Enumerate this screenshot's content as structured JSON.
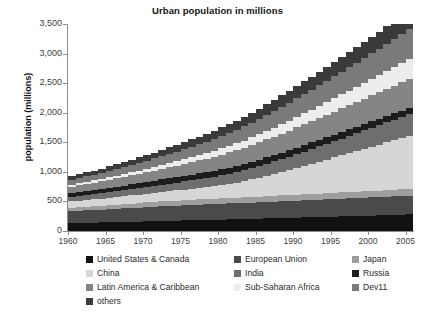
{
  "chart_data": {
    "type": "area",
    "title": "Urban population in millions",
    "xlabel": "",
    "ylabel": "population (millions)",
    "ylim": [
      0,
      3500
    ],
    "xlim": [
      1960,
      2006
    ],
    "ytick_labels": [
      "0",
      "500",
      "1,000",
      "1,500",
      "2,000",
      "2,500",
      "3,000",
      "3,500"
    ],
    "ytick_values": [
      0,
      500,
      1000,
      1500,
      2000,
      2500,
      3000,
      3500
    ],
    "xtick_labels": [
      "1960",
      "1965",
      "1970",
      "1975",
      "1980",
      "1985",
      "1990",
      "1995",
      "2000",
      "2005"
    ],
    "xtick_values": [
      1960,
      1965,
      1970,
      1975,
      1980,
      1985,
      1990,
      1995,
      2000,
      2005
    ],
    "grid": false,
    "stacked": true,
    "legend_position": "bottom",
    "x": [
      1960,
      1961,
      1962,
      1963,
      1964,
      1965,
      1966,
      1967,
      1968,
      1969,
      1970,
      1971,
      1972,
      1973,
      1974,
      1975,
      1976,
      1977,
      1978,
      1979,
      1980,
      1981,
      1982,
      1983,
      1984,
      1985,
      1986,
      1987,
      1988,
      1989,
      1990,
      1991,
      1992,
      1993,
      1994,
      1995,
      1996,
      1997,
      1998,
      1999,
      2000,
      2001,
      2002,
      2003,
      2004,
      2005,
      2006
    ],
    "series": [
      {
        "name": "United States & Canada",
        "color": "#111111",
        "values": [
          133,
          136,
          139,
          142,
          145,
          148,
          151,
          154,
          157,
          160,
          163,
          166,
          169,
          172,
          175,
          178,
          181,
          184,
          187,
          190,
          193,
          196,
          199,
          202,
          205,
          208,
          212,
          215,
          218,
          222,
          225,
          229,
          232,
          236,
          239,
          243,
          247,
          250,
          254,
          258,
          262,
          265,
          269,
          273,
          277,
          281,
          285
        ]
      },
      {
        "name": "European Union",
        "color": "#4a4a4a",
        "values": [
          200,
          204,
          208,
          212,
          216,
          220,
          224,
          228,
          232,
          236,
          240,
          244,
          248,
          251,
          254,
          257,
          260,
          262,
          264,
          266,
          268,
          270,
          272,
          274,
          276,
          278,
          280,
          282,
          284,
          286,
          288,
          290,
          292,
          294,
          296,
          298,
          300,
          302,
          304,
          306,
          308,
          310,
          312,
          314,
          316,
          318,
          320
        ]
      },
      {
        "name": "Japan",
        "color": "#9e9e9e",
        "values": [
          59,
          61,
          63,
          65,
          67,
          69,
          71,
          73,
          75,
          77,
          79,
          81,
          83,
          84,
          85,
          86,
          87,
          88,
          89,
          90,
          91,
          92,
          93,
          94,
          95,
          96,
          97,
          98,
          99,
          100,
          101,
          102,
          103,
          104,
          104,
          105,
          105,
          106,
          106,
          107,
          107,
          108,
          108,
          109,
          109,
          110,
          110
        ]
      },
      {
        "name": "China",
        "color": "#d6d6d6",
        "values": [
          107,
          110,
          113,
          117,
          121,
          125,
          130,
          134,
          139,
          144,
          149,
          155,
          161,
          167,
          173,
          180,
          188,
          196,
          205,
          215,
          226,
          240,
          256,
          275,
          296,
          320,
          345,
          370,
          396,
          422,
          450,
          478,
          508,
          538,
          568,
          598,
          628,
          658,
          688,
          718,
          748,
          778,
          808,
          838,
          868,
          898,
          928
        ]
      },
      {
        "name": "India",
        "color": "#6e6e6e",
        "values": [
          79,
          82,
          85,
          88,
          91,
          95,
          98,
          102,
          106,
          110,
          114,
          118,
          122,
          127,
          132,
          137,
          142,
          147,
          152,
          158,
          164,
          170,
          176,
          183,
          190,
          197,
          204,
          211,
          219,
          226,
          234,
          242,
          250,
          258,
          267,
          275,
          284,
          293,
          302,
          311,
          320,
          329,
          339,
          348,
          358,
          368,
          378
        ]
      },
      {
        "name": "Russia",
        "color": "#1c1c1c",
        "values": [
          64,
          66,
          68,
          70,
          72,
          74,
          76,
          78,
          80,
          82,
          84,
          86,
          88,
          90,
          92,
          94,
          96,
          98,
          100,
          102,
          104,
          105,
          106,
          107,
          108,
          109,
          110,
          110,
          111,
          112,
          113,
          113,
          113,
          112,
          112,
          111,
          111,
          110,
          110,
          109,
          109,
          108,
          108,
          107,
          107,
          106,
          106
        ]
      },
      {
        "name": "Latin America & Caribbean",
        "color": "#858585",
        "values": [
          107,
          112,
          117,
          122,
          127,
          133,
          139,
          145,
          151,
          158,
          165,
          172,
          179,
          187,
          195,
          203,
          211,
          219,
          228,
          237,
          246,
          255,
          264,
          273,
          283,
          292,
          302,
          311,
          321,
          331,
          341,
          350,
          360,
          370,
          380,
          390,
          399,
          409,
          419,
          429,
          439,
          448,
          458,
          468,
          478,
          488,
          498
        ]
      },
      {
        "name": "Sub-Saharan Africa",
        "color": "#ededed",
        "values": [
          34,
          36,
          38,
          40,
          42,
          45,
          47,
          50,
          53,
          56,
          59,
          63,
          66,
          70,
          74,
          78,
          83,
          88,
          93,
          98,
          104,
          110,
          116,
          122,
          129,
          136,
          143,
          151,
          159,
          167,
          176,
          185,
          194,
          204,
          214,
          224,
          235,
          246,
          257,
          269,
          281,
          293,
          306,
          319,
          332,
          346,
          360
        ]
      },
      {
        "name": "Dev11",
        "color": "#7a7a7a",
        "values": [
          86,
          90,
          94,
          98,
          103,
          108,
          113,
          118,
          124,
          130,
          136,
          142,
          149,
          156,
          163,
          170,
          178,
          186,
          194,
          203,
          212,
          221,
          230,
          240,
          250,
          260,
          270,
          281,
          292,
          303,
          314,
          325,
          337,
          348,
          360,
          372,
          384,
          396,
          408,
          420,
          433,
          445,
          458,
          470,
          483,
          496,
          509
        ]
      },
      {
        "name": "others",
        "color": "#3a3a3a",
        "values": [
          60,
          63,
          66,
          69,
          72,
          76,
          79,
          83,
          87,
          91,
          95,
          99,
          104,
          108,
          113,
          118,
          123,
          128,
          133,
          139,
          145,
          150,
          156,
          162,
          168,
          174,
          181,
          187,
          194,
          200,
          207,
          214,
          221,
          228,
          235,
          242,
          250,
          257,
          265,
          272,
          280,
          288,
          296,
          304,
          312,
          320,
          328
        ]
      }
    ]
  },
  "legend": {
    "rows": [
      [
        {
          "label": "United States & Canada",
          "color": "#111111"
        },
        {
          "label": "European Union",
          "color": "#4a4a4a"
        },
        {
          "label": "Japan",
          "color": "#9e9e9e"
        }
      ],
      [
        {
          "label": "China",
          "color": "#d6d6d6"
        },
        {
          "label": "India",
          "color": "#6e6e6e"
        },
        {
          "label": "Russia",
          "color": "#1c1c1c"
        }
      ],
      [
        {
          "label": "Latin America & Caribbean",
          "color": "#858585"
        },
        {
          "label": "Sub-Saharan Africa",
          "color": "#ededed"
        },
        {
          "label": "Dev11",
          "color": "#7a7a7a"
        }
      ],
      [
        {
          "label": "others",
          "color": "#3a3a3a"
        }
      ]
    ]
  }
}
